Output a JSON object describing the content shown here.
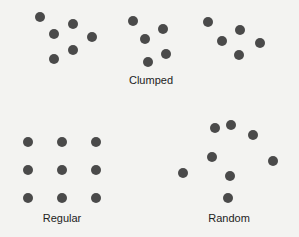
{
  "colors": {
    "background": "#f3f3f1",
    "dot": "#4a4a4a",
    "text": "#222222"
  },
  "dot_radius": 5,
  "patterns": [
    {
      "id": "clumped",
      "label": "Clumped",
      "label_pos": [
        151,
        74
      ],
      "dots": [
        [
          40,
          17
        ],
        [
          73,
          24
        ],
        [
          54,
          34
        ],
        [
          92,
          37
        ],
        [
          73,
          50
        ],
        [
          54,
          59
        ],
        [
          133,
          21
        ],
        [
          163,
          29
        ],
        [
          145,
          39
        ],
        [
          166,
          54
        ],
        [
          148,
          62
        ],
        [
          208,
          22
        ],
        [
          240,
          30
        ],
        [
          222,
          41
        ],
        [
          260,
          43
        ],
        [
          239,
          55
        ]
      ]
    },
    {
      "id": "regular",
      "label": "Regular",
      "label_pos": [
        62,
        212
      ],
      "dots": [
        [
          28,
          142
        ],
        [
          62,
          142
        ],
        [
          96,
          142
        ],
        [
          28,
          170
        ],
        [
          62,
          170
        ],
        [
          96,
          170
        ],
        [
          28,
          198
        ],
        [
          62,
          198
        ],
        [
          96,
          198
        ]
      ]
    },
    {
      "id": "random",
      "label": "Random",
      "label_pos": [
        229,
        212
      ],
      "dots": [
        [
          215,
          128
        ],
        [
          231,
          125
        ],
        [
          253,
          135
        ],
        [
          212,
          157
        ],
        [
          273,
          161
        ],
        [
          183,
          173
        ],
        [
          230,
          176
        ],
        [
          228,
          198
        ]
      ]
    }
  ]
}
